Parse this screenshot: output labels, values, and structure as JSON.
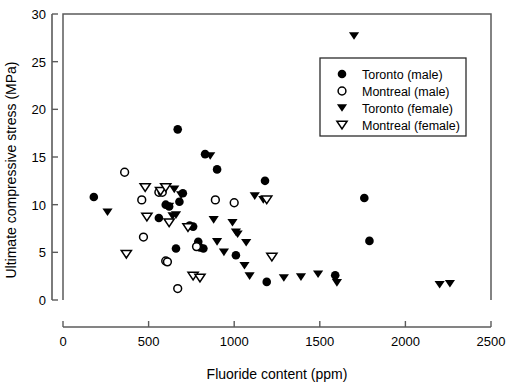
{
  "chart_data": {
    "type": "scatter",
    "title": "",
    "xlabel": "Fluoride content (ppm)",
    "ylabel": "Ultimate compressive stress (MPa)",
    "xlim": [
      0,
      2500
    ],
    "ylim": [
      0,
      30
    ],
    "xticks": [
      0,
      500,
      1000,
      1500,
      2000,
      2500
    ],
    "yticks": [
      0,
      5,
      10,
      15,
      20,
      25,
      30
    ],
    "grid": false,
    "legend_position": "top-right",
    "series": [
      {
        "name": "Toronto (male)",
        "marker": "filled-circle",
        "color": "#000000",
        "points": [
          [
            180,
            10.8
          ],
          [
            600,
            10.0
          ],
          [
            620,
            9.8
          ],
          [
            560,
            8.6
          ],
          [
            670,
            17.9
          ],
          [
            660,
            5.4
          ],
          [
            700,
            11.2
          ],
          [
            740,
            7.8
          ],
          [
            760,
            7.7
          ],
          [
            790,
            6.1
          ],
          [
            800,
            5.5
          ],
          [
            820,
            5.4
          ],
          [
            830,
            15.3
          ],
          [
            680,
            10.3
          ],
          [
            900,
            13.7
          ],
          [
            1010,
            4.7
          ],
          [
            1180,
            12.5
          ],
          [
            1190,
            1.9
          ],
          [
            1590,
            2.6
          ],
          [
            1760,
            10.7
          ],
          [
            1790,
            6.2
          ]
        ]
      },
      {
        "name": "Montreal (male)",
        "marker": "open-circle",
        "color": "#000000",
        "points": [
          [
            360,
            13.4
          ],
          [
            460,
            10.5
          ],
          [
            470,
            6.6
          ],
          [
            560,
            11.3
          ],
          [
            580,
            11.3
          ],
          [
            600,
            4.1
          ],
          [
            610,
            4.0
          ],
          [
            670,
            1.2
          ],
          [
            780,
            5.6
          ],
          [
            890,
            10.5
          ],
          [
            1000,
            10.2
          ]
        ]
      },
      {
        "name": "Toronto (female)",
        "marker": "filled-triangle",
        "color": "#000000",
        "points": [
          [
            260,
            9.2
          ],
          [
            620,
            9.8
          ],
          [
            640,
            8.8
          ],
          [
            650,
            11.6
          ],
          [
            660,
            8.9
          ],
          [
            690,
            11.0
          ],
          [
            860,
            15.1
          ],
          [
            880,
            8.4
          ],
          [
            900,
            6.1
          ],
          [
            940,
            5.0
          ],
          [
            990,
            8.1
          ],
          [
            1010,
            7.1
          ],
          [
            1020,
            6.9
          ],
          [
            1060,
            3.6
          ],
          [
            1070,
            6.0
          ],
          [
            1090,
            2.5
          ],
          [
            1120,
            10.9
          ],
          [
            1170,
            10.5
          ],
          [
            1290,
            2.3
          ],
          [
            1390,
            2.4
          ],
          [
            1490,
            2.7
          ],
          [
            1600,
            1.8
          ],
          [
            1700,
            27.7
          ],
          [
            2200,
            1.6
          ],
          [
            2260,
            1.7
          ]
        ]
      },
      {
        "name": "Montreal (female)",
        "marker": "open-triangle",
        "color": "#000000",
        "points": [
          [
            370,
            4.8
          ],
          [
            480,
            11.8
          ],
          [
            490,
            8.7
          ],
          [
            570,
            11.4
          ],
          [
            600,
            11.8
          ],
          [
            620,
            8.1
          ],
          [
            730,
            7.6
          ],
          [
            760,
            2.5
          ],
          [
            800,
            2.3
          ],
          [
            1220,
            4.5
          ],
          [
            1190,
            10.5
          ]
        ]
      }
    ]
  },
  "legend": {
    "entries": [
      {
        "label": "Toronto (male)",
        "marker": "filled-circle"
      },
      {
        "label": "Montreal (male)",
        "marker": "open-circle"
      },
      {
        "label": "Toronto (female)",
        "marker": "filled-triangle"
      },
      {
        "label": "Montreal (female)",
        "marker": "open-triangle"
      }
    ]
  },
  "axes": {
    "x_title": "Fluoride content (ppm)",
    "y_title": "Ultimate compressive stress (MPa)",
    "x_tick_labels": [
      "0",
      "500",
      "1000",
      "1500",
      "2000",
      "2500"
    ],
    "y_tick_labels": [
      "0",
      "5",
      "10",
      "15",
      "20",
      "25",
      "30"
    ]
  }
}
